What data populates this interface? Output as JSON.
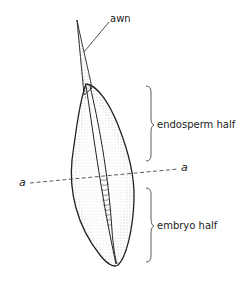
{
  "diagram": {
    "labels": {
      "awn": "awn",
      "endosperm": "endosperm half",
      "embryo": "embryo half",
      "axis_left": "a",
      "axis_right": "a"
    },
    "colors": {
      "stroke": "#222222",
      "stipple": "#888888",
      "background": "#ffffff"
    }
  }
}
